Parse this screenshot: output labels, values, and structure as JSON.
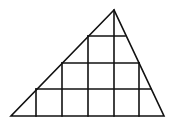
{
  "diagram": {
    "type": "triangle-grid-puzzle",
    "stroke_color": "#111111",
    "background": "#ffffff",
    "triangle": {
      "apex": [
        114,
        10
      ],
      "bottom_left": [
        11,
        116
      ],
      "bottom_right": [
        164,
        116
      ]
    },
    "horizontal_lines": [
      {
        "y": 36,
        "x1": 88,
        "x2": 125
      },
      {
        "y": 63,
        "x1": 62,
        "x2": 139
      },
      {
        "y": 89,
        "x1": 36,
        "x2": 151
      }
    ],
    "vertical_lines": [
      {
        "x": 36,
        "y1": 89,
        "y2": 116
      },
      {
        "x": 62,
        "y1": 63,
        "y2": 116
      },
      {
        "x": 88,
        "y1": 36,
        "y2": 116
      },
      {
        "x": 114,
        "y1": 10,
        "y2": 116
      },
      {
        "x": 139,
        "y1": 63,
        "y2": 116
      }
    ]
  }
}
